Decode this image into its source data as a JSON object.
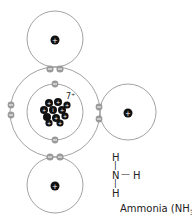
{
  "diagram": {
    "nucleus_label": "7+",
    "nucleus_particle_sign": "+",
    "electron_sign": "−",
    "hydrogen_nucleus_sign": "+",
    "structural_formula": {
      "top": "H",
      "top_bond": "|",
      "center": "N",
      "right_bond": "—",
      "right": "H",
      "bottom_bond": "|",
      "bottom": "H"
    },
    "caption": "Ammonia (NH",
    "caption_subscript": "3",
    "caption_end": ")."
  },
  "colors": {
    "orbit": "#8a8a8a",
    "electron": "#9a9a9a",
    "nucleus": "#111111"
  }
}
